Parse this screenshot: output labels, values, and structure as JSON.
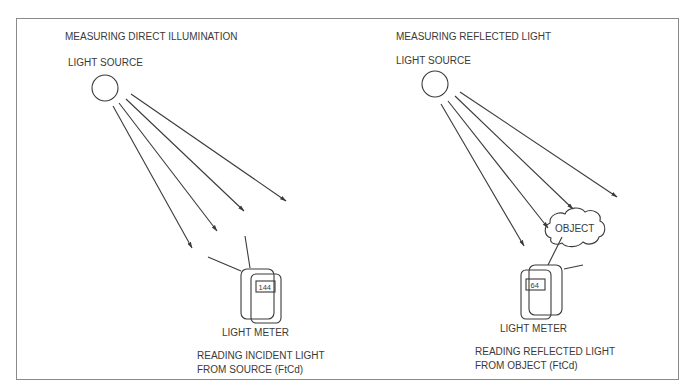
{
  "panels": [
    {
      "title": "MEASURING DIRECT ILLUMINATION",
      "source_label": "LIGHT SOURCE",
      "meter_label": "LIGHT METER",
      "meter_value": "144",
      "caption_line1": "READING INCIDENT LIGHT",
      "caption_line2": "FROM SOURCE (FtCd)"
    },
    {
      "title": "MEASURING REFLECTED LIGHT",
      "source_label": "LIGHT SOURCE",
      "object_label": "OBJECT",
      "meter_label": "LIGHT METER",
      "meter_value": "64",
      "caption_line1": "READING REFLECTED LIGHT",
      "caption_line2": "FROM OBJECT (FtCd)"
    }
  ],
  "colors": {
    "line": "#3a3a3a",
    "frame": "#8a8a8a",
    "background": "#ffffff"
  }
}
